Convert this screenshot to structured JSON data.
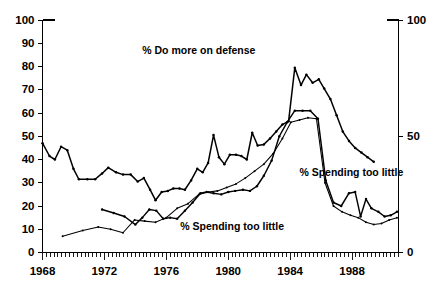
{
  "chart_data": {
    "type": "line",
    "title": "",
    "subtitle": "",
    "xlabel": "",
    "ylabel": "",
    "ylim": [
      0,
      100
    ],
    "xlim": [
      1968,
      1991
    ],
    "grid": false,
    "legend_position": "inline-annotations",
    "y_axis_left": {
      "ticks": [
        0,
        10,
        20,
        30,
        40,
        50,
        60,
        70,
        80,
        90,
        100
      ],
      "tick_labels": [
        "0",
        "10",
        "20",
        "30",
        "40",
        "50",
        "60",
        "70",
        "80",
        "90",
        "100"
      ]
    },
    "y_axis_right": {
      "ticks": [
        0,
        50,
        100
      ],
      "tick_labels": [
        "0",
        "50",
        "100"
      ]
    },
    "x_axis": {
      "major_ticks": [
        1968,
        1972,
        1976,
        1980,
        1984,
        1988
      ],
      "major_tick_labels": [
        "1968",
        "1972",
        "1976",
        "1980",
        "1984",
        "1988"
      ],
      "minor_tick_interval": 0.25,
      "minor_tick_start": 1968,
      "minor_tick_end": 1991
    },
    "annotations": [
      {
        "name": "defense-label",
        "text": "% Do more on defense",
        "x": 1978.1,
        "y": 85.5,
        "anchor": "middle"
      },
      {
        "name": "spending-right-label",
        "text": "% Spending too little",
        "x": 1984.6,
        "y": 33.0,
        "anchor": "start"
      },
      {
        "name": "spending-low-label",
        "text": "% Spending too little",
        "x": 1976.9,
        "y": 9.5,
        "anchor": "start"
      }
    ],
    "series": [
      {
        "name": "% Do more on defense",
        "style": "thick",
        "points": [
          [
            1968.0,
            47.0
          ],
          [
            1968.45,
            41.5
          ],
          [
            1968.8,
            40.0
          ],
          [
            1969.2,
            45.5
          ],
          [
            1969.6,
            44.0
          ],
          [
            1970.0,
            36.0
          ],
          [
            1970.35,
            31.5
          ],
          [
            1970.9,
            31.5
          ],
          [
            1971.4,
            31.5
          ],
          [
            1971.85,
            34.0
          ],
          [
            1972.25,
            36.5
          ],
          [
            1972.75,
            34.5
          ],
          [
            1973.2,
            33.5
          ],
          [
            1973.7,
            33.5
          ],
          [
            1974.15,
            30.5
          ],
          [
            1974.55,
            32.0
          ],
          [
            1974.95,
            27.0
          ],
          [
            1975.3,
            22.5
          ],
          [
            1975.7,
            26.0
          ],
          [
            1976.1,
            26.5
          ],
          [
            1976.45,
            27.5
          ],
          [
            1976.85,
            27.5
          ],
          [
            1977.2,
            27.0
          ],
          [
            1977.6,
            31.0
          ],
          [
            1978.0,
            36.0
          ],
          [
            1978.35,
            34.5
          ],
          [
            1978.7,
            38.5
          ],
          [
            1979.05,
            50.5
          ],
          [
            1979.4,
            41.0
          ],
          [
            1979.75,
            38.0
          ],
          [
            1980.1,
            42.0
          ],
          [
            1980.5,
            42.0
          ],
          [
            1980.85,
            41.5
          ],
          [
            1981.2,
            40.0
          ],
          [
            1981.55,
            51.5
          ],
          [
            1981.9,
            46.0
          ],
          [
            1982.3,
            46.5
          ],
          [
            1982.7,
            49.0
          ],
          [
            1983.1,
            52.0
          ],
          [
            1983.5,
            55.0
          ],
          [
            1983.9,
            56.5
          ],
          [
            1984.3,
            79.5
          ],
          [
            1984.7,
            72.0
          ],
          [
            1985.05,
            76.5
          ],
          [
            1985.45,
            73.0
          ],
          [
            1985.85,
            74.5
          ],
          [
            1986.2,
            70.5
          ],
          [
            1986.6,
            66.0
          ],
          [
            1987.0,
            59.0
          ],
          [
            1987.4,
            52.0
          ],
          [
            1987.8,
            48.0
          ],
          [
            1988.2,
            45.0
          ],
          [
            1988.6,
            43.0
          ],
          [
            1989.0,
            41.0
          ],
          [
            1989.4,
            39.0
          ]
        ]
      },
      {
        "name": "% Spending too little (A)",
        "style": "medium",
        "points": [
          [
            1971.85,
            18.5
          ],
          [
            1972.6,
            17.0
          ],
          [
            1973.3,
            15.5
          ],
          [
            1974.0,
            12.0
          ],
          [
            1974.45,
            15.0
          ],
          [
            1974.9,
            18.5
          ],
          [
            1975.35,
            18.0
          ],
          [
            1975.8,
            14.5
          ],
          [
            1976.25,
            15.0
          ],
          [
            1976.7,
            14.5
          ],
          [
            1977.2,
            18.0
          ],
          [
            1977.7,
            21.5
          ],
          [
            1978.2,
            25.5
          ],
          [
            1978.6,
            26.0
          ],
          [
            1979.05,
            25.5
          ],
          [
            1979.55,
            25.0
          ],
          [
            1980.0,
            26.0
          ],
          [
            1980.45,
            26.5
          ],
          [
            1980.95,
            27.0
          ],
          [
            1981.4,
            26.5
          ],
          [
            1981.85,
            28.5
          ],
          [
            1982.3,
            33.0
          ],
          [
            1982.8,
            39.5
          ],
          [
            1983.3,
            50.0
          ],
          [
            1983.8,
            56.0
          ],
          [
            1984.3,
            61.0
          ],
          [
            1984.8,
            61.0
          ],
          [
            1985.3,
            61.0
          ],
          [
            1985.8,
            57.5
          ],
          [
            1986.3,
            31.0
          ],
          [
            1986.8,
            21.5
          ],
          [
            1987.3,
            20.0
          ],
          [
            1987.8,
            25.5
          ],
          [
            1988.2,
            26.0
          ],
          [
            1988.55,
            15.5
          ],
          [
            1988.9,
            23.0
          ],
          [
            1989.25,
            19.0
          ],
          [
            1989.7,
            17.5
          ],
          [
            1990.1,
            15.5
          ],
          [
            1990.5,
            16.0
          ],
          [
            1990.9,
            17.5
          ],
          [
            1991.3,
            17.5
          ],
          [
            1991.7,
            16.0
          ],
          [
            1992.1,
            15.5
          ],
          [
            1992.5,
            16.0
          ],
          [
            1992.9,
            17.5
          ],
          [
            1993.3,
            17.0
          ],
          [
            1993.7,
            15.5
          ],
          [
            1994.1,
            13.5
          ],
          [
            1994.5,
            11.0
          ],
          [
            1994.9,
            15.0
          ],
          [
            1995.3,
            13.0
          ],
          [
            1995.7,
            15.0
          ]
        ]
      },
      {
        "name": "% Spending too little (B)",
        "style": "thin",
        "points": [
          [
            1969.3,
            7.0
          ],
          [
            1970.6,
            9.5
          ],
          [
            1971.6,
            11.0
          ],
          [
            1972.4,
            10.0
          ],
          [
            1973.2,
            8.5
          ],
          [
            1973.95,
            14.0
          ],
          [
            1974.6,
            13.5
          ],
          [
            1975.3,
            13.0
          ],
          [
            1976.0,
            15.0
          ],
          [
            1976.7,
            19.0
          ],
          [
            1977.4,
            21.0
          ],
          [
            1978.1,
            25.0
          ],
          [
            1978.7,
            26.0
          ],
          [
            1979.3,
            26.5
          ],
          [
            1979.9,
            28.0
          ],
          [
            1980.5,
            29.5
          ],
          [
            1981.1,
            32.0
          ],
          [
            1981.7,
            35.0
          ],
          [
            1982.3,
            38.0
          ],
          [
            1982.9,
            42.5
          ],
          [
            1983.5,
            49.0
          ],
          [
            1984.05,
            56.0
          ],
          [
            1984.6,
            57.0
          ],
          [
            1985.15,
            58.0
          ],
          [
            1985.7,
            57.5
          ],
          [
            1986.25,
            30.0
          ],
          [
            1986.8,
            20.0
          ],
          [
            1987.35,
            17.5
          ],
          [
            1987.9,
            16.0
          ],
          [
            1988.4,
            15.0
          ],
          [
            1988.9,
            13.0
          ],
          [
            1989.4,
            12.0
          ],
          [
            1989.9,
            12.5
          ],
          [
            1990.4,
            14.0
          ],
          [
            1990.9,
            15.0
          ],
          [
            1991.4,
            15.5
          ],
          [
            1991.9,
            15.5
          ],
          [
            1992.4,
            15.0
          ],
          [
            1992.9,
            14.5
          ],
          [
            1993.4,
            13.5
          ],
          [
            1993.9,
            12.5
          ],
          [
            1994.4,
            11.0
          ],
          [
            1994.9,
            11.5
          ],
          [
            1995.4,
            11.0
          ],
          [
            1995.9,
            11.0
          ],
          [
            1996.4,
            11.0
          ]
        ]
      }
    ]
  }
}
